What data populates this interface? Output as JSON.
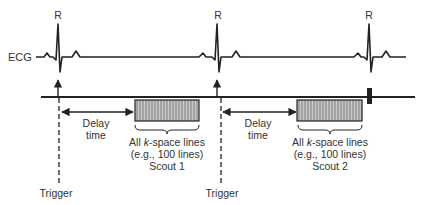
{
  "ecg": {
    "label": "ECG",
    "peaks": [
      {
        "label": "R",
        "x": 58
      },
      {
        "label": "R",
        "x": 217
      },
      {
        "label": "R",
        "x": 369
      }
    ]
  },
  "triggers": [
    {
      "label": "Trigger",
      "x": 58
    },
    {
      "label": "Trigger",
      "x": 217
    }
  ],
  "delays": [
    {
      "line1": "Delay",
      "line2": "time"
    },
    {
      "line1": "Delay",
      "line2": "time"
    }
  ],
  "scouts": [
    {
      "line1_pre": "All ",
      "line1_italic": "k",
      "line1_post": "-space lines",
      "line2": "(e.g., 100 lines)",
      "line3": "Scout 1"
    },
    {
      "line1_pre": "All ",
      "line1_italic": "k",
      "line1_post": "-space lines",
      "line2": "(e.g., 100 lines)",
      "line3": "Scout 2"
    }
  ],
  "colors": {
    "line": "#222222",
    "block_fill": "#9a9a9a",
    "block_stripe": "#c4c4c4"
  }
}
